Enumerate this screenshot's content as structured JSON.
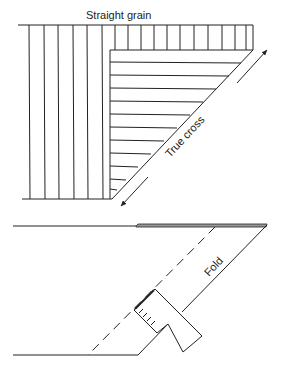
{
  "figure": {
    "top_diagram": {
      "title": "Straight grain",
      "diagonal_label": "True cross",
      "arrow_direction": "bidirectional-along-bias"
    },
    "bottom_diagram": {
      "fold_label": "Fold",
      "tool": "hem-gauge"
    }
  },
  "colors": {
    "ink": "#222222",
    "background": "#ffffff"
  }
}
